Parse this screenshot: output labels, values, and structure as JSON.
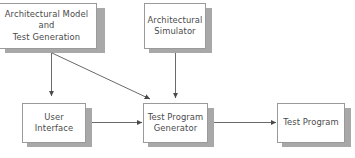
{
  "diagram": {
    "canvas": {
      "width": 355,
      "height": 158
    },
    "colors": {
      "background": "#ffffff",
      "box_border": "#9a9a9a",
      "box_fill": "#ffffff",
      "shadow": "#a8a8a8",
      "text": "#4a4a4a",
      "edge": "#6a6a6a"
    },
    "nodes": [
      {
        "id": "architectural-model-and-test-generation",
        "label": "Architectural Model\nand\nTest Generation",
        "x": -4,
        "y": 3,
        "w": 101,
        "h": 46
      },
      {
        "id": "architectural-simulator",
        "label": "Architectural\nSimulator",
        "x": 144,
        "y": 3,
        "w": 62,
        "h": 46
      },
      {
        "id": "user-interface",
        "label": "User\nInterface",
        "x": 22,
        "y": 103,
        "w": 64,
        "h": 40
      },
      {
        "id": "test-program-generator",
        "label": "Test Program\nGenerator",
        "x": 143,
        "y": 103,
        "w": 65,
        "h": 40
      },
      {
        "id": "test-program",
        "label": "Test Program",
        "x": 277,
        "y": 103,
        "w": 68,
        "h": 40
      }
    ],
    "edges": [
      {
        "id": "model-to-user-interface",
        "from": "architectural-model-and-test-generation",
        "to": "user-interface",
        "kind": "vertical-arrow"
      },
      {
        "id": "model-to-generator",
        "from": "architectural-model-and-test-generation",
        "to": "test-program-generator",
        "kind": "diagonal-arrow"
      },
      {
        "id": "simulator-to-generator",
        "from": "architectural-simulator",
        "to": "test-program-generator",
        "kind": "vertical-arrow"
      },
      {
        "id": "user-interface-to-generator",
        "from": "user-interface",
        "to": "test-program-generator",
        "kind": "horizontal-arrow"
      },
      {
        "id": "generator-to-test-program",
        "from": "test-program-generator",
        "to": "test-program",
        "kind": "horizontal-arrow"
      }
    ]
  }
}
